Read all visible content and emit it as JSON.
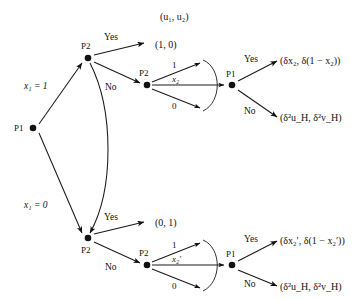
{
  "figure": {
    "type": "game-tree",
    "header_label": "(u₁, u₂)",
    "background": "#ffffff",
    "ink": "#111111"
  },
  "nodes": {
    "root": {
      "player": "P1",
      "x": 33,
      "y": 128
    },
    "p2_upper": {
      "player": "P2",
      "x": 88,
      "y": 58
    },
    "p2_lower": {
      "player": "P2",
      "x": 88,
      "y": 238
    },
    "p2_upper_second": {
      "player": "P2",
      "x": 147,
      "y": 85
    },
    "p2_lower_second": {
      "player": "P2",
      "x": 147,
      "y": 265
    },
    "p1_upper": {
      "player": "P1",
      "x": 232,
      "y": 85
    },
    "p1_lower": {
      "player": "P1",
      "x": 232,
      "y": 265
    }
  },
  "edges": {
    "root_up_label": "x₁ = 1",
    "root_down_label": "x₁ = 0",
    "upper_yes": "Yes",
    "upper_no": "No",
    "lower_yes": "Yes",
    "lower_no": "No",
    "p1_upper_yes": "Yes",
    "p1_upper_no": "No",
    "p1_lower_yes": "Yes",
    "p1_lower_no": "No"
  },
  "fan_upper": {
    "top_label": "1",
    "mid_label": "x₂",
    "bottom_label": "0"
  },
  "fan_lower": {
    "top_label": "1",
    "mid_label": "x₂′",
    "bottom_label": "0"
  },
  "payoffs": {
    "upper_yes": "(1, 0)",
    "lower_yes": "(0, 1)",
    "upper_p1_yes": "(δx₂, δ(1 − x₂))",
    "upper_p1_no": "(δ²u_H, δ²v_H)",
    "lower_p1_yes": "(δx₂′, δ(1 − x₂′))",
    "lower_p1_no": "(δ²u_H, δ²v_H)"
  }
}
